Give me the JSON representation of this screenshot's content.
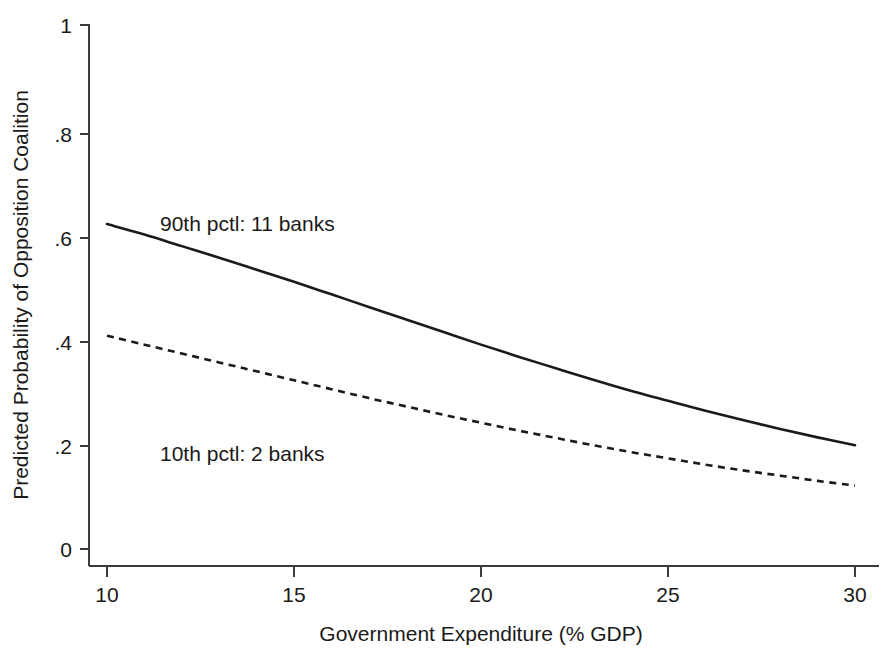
{
  "chart_data": {
    "type": "line",
    "title": "",
    "subtitle": "",
    "xlabel": "Government Expenditure (% GDP)",
    "ylabel": "Predicted Probability of Opposition Coalition",
    "xlim": [
      10,
      30
    ],
    "ylim": [
      0,
      1
    ],
    "xticks": [
      10,
      15,
      20,
      25,
      30
    ],
    "xtick_labels": [
      "10",
      "15",
      "20",
      "25",
      "30"
    ],
    "yticks": [
      0,
      0.2,
      0.4,
      0.6,
      0.8,
      1
    ],
    "ytick_labels": [
      "0",
      ".2",
      ".4",
      ".6",
      ".8",
      "1"
    ],
    "grid": false,
    "legend_position": "inline-annotation",
    "x": [
      10,
      11,
      12,
      13,
      14,
      15,
      16,
      17,
      18,
      19,
      20,
      21,
      22,
      23,
      24,
      25,
      26,
      27,
      28,
      29,
      30
    ],
    "series": [
      {
        "name": "90th pctl: 11 banks",
        "style": "solid",
        "color": "#1a1a1a",
        "annotation": "90th pctl: 11 banks",
        "values": [
          0.62,
          0.6,
          0.578,
          0.556,
          0.533,
          0.51,
          0.486,
          0.462,
          0.438,
          0.414,
          0.39,
          0.367,
          0.345,
          0.323,
          0.302,
          0.283,
          0.264,
          0.246,
          0.229,
          0.213,
          0.198
        ]
      },
      {
        "name": "10th pctl: 2 banks",
        "style": "dashed",
        "color": "#1a1a1a",
        "annotation": "10th pctl: 2 banks",
        "values": [
          0.407,
          0.39,
          0.373,
          0.356,
          0.339,
          0.322,
          0.305,
          0.288,
          0.272,
          0.256,
          0.241,
          0.226,
          0.212,
          0.198,
          0.185,
          0.173,
          0.161,
          0.15,
          0.14,
          0.13,
          0.121
        ]
      }
    ]
  },
  "axes": {
    "x_title": "Government Expenditure (% GDP)",
    "y_title": "Predicted Probability of Opposition Coalition",
    "x_tick_labels": [
      "10",
      "15",
      "20",
      "25",
      "30"
    ],
    "y_tick_labels": [
      "1",
      ".8",
      ".6",
      ".4",
      ".2",
      "0"
    ]
  },
  "annotations": {
    "upper": "90th pctl: 11 banks",
    "lower": "10th pctl: 2 banks"
  },
  "colors": {
    "background": "#ffffff",
    "axis": "#3a3a3a",
    "line": "#1a1a1a",
    "text": "#1a1a1a"
  }
}
